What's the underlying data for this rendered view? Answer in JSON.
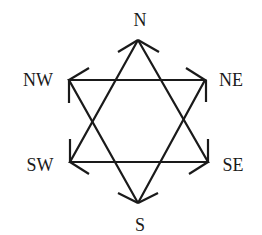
{
  "diagram": {
    "type": "compass-hexagram",
    "labels": {
      "N": "N",
      "NE": "NE",
      "SE": "SE",
      "S": "S",
      "SW": "SW",
      "NW": "NW"
    },
    "triangles": [
      {
        "name": "upward",
        "vertices": [
          "N",
          "SW",
          "SE"
        ]
      },
      {
        "name": "downward",
        "vertices": [
          "S",
          "NW",
          "NE"
        ]
      }
    ],
    "colors": {
      "stroke": "#1a1a1a",
      "background": "#ffffff"
    }
  }
}
